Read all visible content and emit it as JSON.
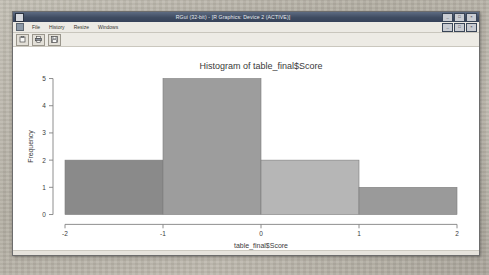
{
  "window": {
    "title": "RGui (32-bit) - [R Graphics: Device 2 (ACTIVE)]",
    "icon_name": "r-app-icon",
    "buttons": [
      {
        "name": "minimize-button",
        "glyph": "_"
      },
      {
        "name": "maximize-button",
        "glyph": "□"
      },
      {
        "name": "close-button",
        "glyph": "×"
      }
    ],
    "inner_buttons": [
      {
        "name": "inner-minimize-button",
        "glyph": "_"
      },
      {
        "name": "inner-restore-button",
        "glyph": "□"
      },
      {
        "name": "inner-close-button",
        "glyph": "×"
      }
    ]
  },
  "menu": {
    "items": [
      {
        "name": "menu-file",
        "label": "File"
      },
      {
        "name": "menu-history",
        "label": "History"
      },
      {
        "name": "menu-resize",
        "label": "Resize"
      },
      {
        "name": "menu-windows",
        "label": "Windows"
      }
    ]
  },
  "toolbar": {
    "buttons": [
      {
        "name": "copy-to-clipboard-button",
        "icon": "clipboard-icon"
      },
      {
        "name": "print-button",
        "icon": "printer-icon"
      },
      {
        "name": "save-as-button",
        "icon": "save-icon"
      }
    ]
  },
  "chart_data": {
    "type": "bar",
    "title": "Histogram of table_final$Score",
    "xlabel": "table_final$Score",
    "ylabel": "Frequency",
    "bin_edges": [
      -2,
      -1,
      0,
      1,
      2
    ],
    "categories": [
      "-2 to -1",
      "-1 to 0",
      "0 to 1",
      "1 to 2"
    ],
    "values": [
      2,
      5,
      2,
      1
    ],
    "bar_colors": [
      "#8a8a8a",
      "#9d9d9d",
      "#b6b6b6",
      "#9a9a9a"
    ],
    "xlim": [
      -2,
      2
    ],
    "ylim": [
      0,
      5
    ],
    "xticks": [
      -2,
      -1,
      0,
      1,
      2
    ],
    "xtick_labels": [
      "-2",
      "-1",
      "0",
      "1",
      "2"
    ],
    "yticks": [
      0,
      1,
      2,
      3,
      4,
      5
    ],
    "ytick_labels": [
      "0",
      "1",
      "2",
      "3",
      "4",
      "5"
    ],
    "grid": false,
    "legend": false,
    "axis_color": "#808080",
    "text_color": "#3a3a3a",
    "plot_background": "#ffffff"
  }
}
